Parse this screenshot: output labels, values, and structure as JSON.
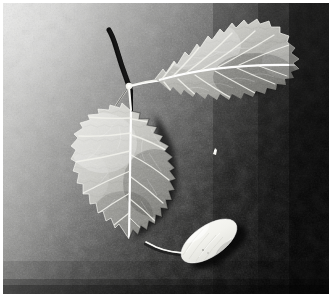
{
  "image": {
    "kind": "black-and-white-photograph",
    "subject": "two poplar leaves on a twig and a white silkworm cocoon",
    "orientation": "landscape",
    "frame": {
      "border_color": "#ffffff",
      "border_px": 3
    },
    "canvas": {
      "width": 335,
      "height": 294,
      "photo_width": 326,
      "photo_height": 291
    }
  },
  "palette": {
    "background_light": "#c4c4c2",
    "background_mid": "#6f6f6e",
    "background_dark": "#1b1b1b",
    "background_darkest": "#0a0a0a",
    "leaf_light": "#d8d8d4",
    "leaf_mid": "#a5a5a1",
    "leaf_shade": "#7b7b78",
    "vein_white": "#f2f2ee",
    "cocoon_white": "#f6f6f2",
    "cocoon_shade": "#d2d2cc",
    "shadow_black": "#080808",
    "frame_white": "#ffffff"
  },
  "background": {
    "name": "textured-gradient-surface",
    "description": "grainy fabric-like surface lit from the upper left, falling off to near black at the right edge",
    "gradient_angle_deg": 20,
    "stops": [
      {
        "offset": 0.0,
        "color": "#d3d3d1"
      },
      {
        "offset": 0.18,
        "color": "#b6b6b4"
      },
      {
        "offset": 0.42,
        "color": "#7a7a78"
      },
      {
        "offset": 0.62,
        "color": "#474746"
      },
      {
        "offset": 0.8,
        "color": "#242423"
      },
      {
        "offset": 1.0,
        "color": "#0d0d0d"
      }
    ]
  },
  "objects": [
    {
      "id": "upper-leaf",
      "name": "upper-leaf",
      "label": "Upper poplar leaf",
      "shape": "deltoid with serrated margin",
      "tip_direction": "right",
      "center": {
        "x": 213,
        "y": 55
      },
      "approx_width": 125,
      "approx_height": 100,
      "vein_count": 9,
      "has_shadow": true
    },
    {
      "id": "lower-leaf",
      "name": "lower-leaf",
      "label": "Lower poplar leaf",
      "shape": "heart-shaped with serrated margin",
      "tip_direction": "down",
      "center": {
        "x": 128,
        "y": 168
      },
      "approx_width": 95,
      "approx_height": 125,
      "vein_count": 9,
      "has_shadow": true
    },
    {
      "id": "twig",
      "name": "twig-stem",
      "label": "Twig with petioles",
      "description": "dark curved twig running up-left from a bright junction node, with pale petioles to each leaf",
      "junction": {
        "x": 126,
        "y": 82
      }
    },
    {
      "id": "cocoon",
      "name": "silkworm-cocoon",
      "label": "White silkworm cocoon",
      "shape": "elongated capsule",
      "center": {
        "x": 206,
        "y": 238
      },
      "length": 62,
      "thickness": 30,
      "tilt_deg": -34,
      "has_shadow": true
    },
    {
      "id": "cocoon-thread",
      "name": "cocoon-thread",
      "label": "Curved silk thread",
      "from": {
        "x": 182,
        "y": 250
      },
      "to": {
        "x": 143,
        "y": 243
      }
    },
    {
      "id": "speck",
      "name": "white-speck",
      "label": "Small bright speck on the background",
      "center": {
        "x": 213,
        "y": 149
      },
      "size": 4
    }
  ]
}
